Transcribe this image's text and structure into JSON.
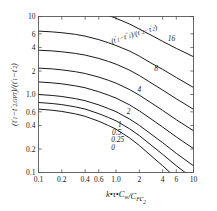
{
  "chart_data": {
    "type": "line",
    "title": "",
    "xlabel": "k·τ·C_w/C_F c_2",
    "ylabel": "(t'_1 − t''_{2,OPT})/(t'_1 − t'_2)",
    "xscale": "log",
    "yscale": "log",
    "xlim": [
      0.1,
      10
    ],
    "ylim": [
      0.1,
      10
    ],
    "grid": false,
    "legend_position": "inline-curve-labels",
    "annotation": "(t'_1 − t''_1)/(t''_2 − t'_2)",
    "xticklabels": [
      "0.1",
      "0.2",
      "0.4",
      "0.6",
      "1.0",
      "2",
      "4",
      "6",
      "10"
    ],
    "xtickvalues": [
      0.1,
      0.2,
      0.4,
      0.6,
      1.0,
      2,
      4,
      6,
      10
    ],
    "yticklabels": [
      "10",
      "6",
      "4",
      "2",
      "1.0",
      "0.6",
      "0.4",
      "0.2",
      "0.1"
    ],
    "ytickvalues": [
      10,
      6,
      4,
      2,
      1.0,
      0.6,
      0.4,
      0.2,
      0.1
    ],
    "x": [
      0.1,
      0.15,
      0.2,
      0.3,
      0.4,
      0.6,
      0.8,
      1.0,
      1.5,
      2,
      3,
      4,
      6,
      8,
      10
    ],
    "series": [
      {
        "name": "16",
        "label": "16",
        "values": [
          15.5,
          15.0,
          14.5,
          13.6,
          12.8,
          11.4,
          10.3,
          9.5,
          8.0,
          6.9,
          5.6,
          4.8,
          3.9,
          3.4,
          3.05
        ]
      },
      {
        "name": "8",
        "label": "8",
        "values": [
          6.5,
          6.35,
          6.2,
          5.9,
          5.6,
          5.05,
          4.6,
          4.25,
          3.6,
          3.1,
          2.45,
          2.1,
          1.65,
          1.4,
          1.23
        ]
      },
      {
        "name": "4",
        "label": "4",
        "values": [
          3.7,
          3.62,
          3.53,
          3.36,
          3.2,
          2.9,
          2.65,
          2.45,
          2.05,
          1.75,
          1.36,
          1.14,
          0.88,
          0.74,
          0.645
        ]
      },
      {
        "name": "2",
        "label": "2",
        "values": [
          2.18,
          2.13,
          2.07,
          1.96,
          1.86,
          1.67,
          1.52,
          1.4,
          1.155,
          0.98,
          0.755,
          0.625,
          0.475,
          0.395,
          0.343
        ]
      },
      {
        "name": "1",
        "label": "1",
        "values": [
          1.45,
          1.41,
          1.37,
          1.29,
          1.22,
          1.085,
          0.98,
          0.9,
          0.735,
          0.617,
          0.467,
          0.382,
          0.286,
          0.235,
          0.203
        ]
      },
      {
        "name": "0.5",
        "label": "0.5",
        "values": [
          1.0,
          0.972,
          0.943,
          0.885,
          0.833,
          0.735,
          0.66,
          0.603,
          0.484,
          0.402,
          0.298,
          0.241,
          0.176,
          0.143,
          0.122
        ]
      },
      {
        "name": "0.25",
        "label": "0.25",
        "values": [
          0.79,
          0.766,
          0.742,
          0.693,
          0.65,
          0.568,
          0.507,
          0.46,
          0.363,
          0.297,
          0.215,
          0.171,
          0.122,
          0.098,
          0.083
        ]
      },
      {
        "name": "0",
        "label": "0",
        "values": [
          0.65,
          0.628,
          0.607,
          0.564,
          0.525,
          0.454,
          0.4,
          0.359,
          0.277,
          0.222,
          0.156,
          0.122,
          0.0845,
          0.0665,
          0.0558
        ]
      }
    ],
    "curve_label_points": [
      {
        "label": "16",
        "x": 5.2,
        "y": 4.9
      },
      {
        "label": "8",
        "x": 3.3,
        "y": 2.0
      },
      {
        "label": "4",
        "x": 2.0,
        "y": 1.07
      },
      {
        "label": "2",
        "x": 1.45,
        "y": 0.565
      },
      {
        "label": "1",
        "x": 1.12,
        "y": 0.385
      },
      {
        "label": "0.5",
        "x": 1.02,
        "y": 0.305
      },
      {
        "label": "0.25",
        "x": 1.05,
        "y": 0.247
      },
      {
        "label": "0",
        "x": 0.92,
        "y": 0.193
      }
    ]
  },
  "yaxis_title": {
    "p1": "(",
    "t1p": "t",
    "t1p_sup": "′",
    "t1p_sub": "1",
    "minus1": "−",
    "t2opt": "t",
    "t2opt_sup": "″",
    "t2opt_sub": "2,OPT",
    "p2": ")/(",
    "t1p2": "t",
    "t1p2_sup": "′",
    "t1p2_sub": "1",
    "minus2": "−",
    "t2p": "t",
    "t2p_sup": "′",
    "t2p_sub": "2",
    "p3": ")"
  },
  "xaxis_title": {
    "k": "k",
    "dot1": "•",
    "tau": "τ",
    "dot2": "•",
    "C": "C",
    "w": "w",
    "slash": "/",
    "C2": "C",
    "F": "F",
    "c": "c",
    "two": "2"
  },
  "annotation_text": {
    "open": "(",
    "t1p": "t",
    "t1p_sup": "′",
    "t1p_sub": "1",
    "minus": "−",
    "t1pp": "t",
    "t1pp_sup": "″",
    "t1pp_sub": "1",
    "mid": ")/(",
    "t2pp": "t",
    "t2pp_sup": "″",
    "t2pp_sub": "2",
    "minus2": "−",
    "t2p": "t",
    "t2p_sup": "′",
    "t2p_sub": "2",
    "close": ")"
  },
  "colors": {
    "curve": "#1a1a1a",
    "frame": "#555555",
    "text": "#1a1a1a",
    "background": "#ffffff"
  }
}
